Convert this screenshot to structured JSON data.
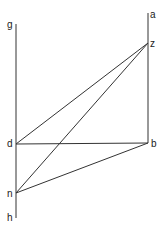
{
  "diagram": {
    "points": {
      "g": {
        "label": "g",
        "x": 16,
        "y": 24
      },
      "a": {
        "label": "a",
        "x": 148,
        "y": 13
      },
      "z": {
        "label": "z",
        "x": 148,
        "y": 43
      },
      "d": {
        "label": "d",
        "x": 16,
        "y": 144
      },
      "b": {
        "label": "b",
        "x": 148,
        "y": 143
      },
      "n": {
        "label": "n",
        "x": 16,
        "y": 193
      },
      "h": {
        "label": "h",
        "x": 16,
        "y": 218
      }
    },
    "segments": [
      [
        "g",
        "h"
      ],
      [
        "a",
        "b"
      ],
      [
        "d",
        "z"
      ],
      [
        "n",
        "z"
      ],
      [
        "d",
        "b"
      ],
      [
        "n",
        "b"
      ]
    ],
    "line_color": "#333333"
  }
}
